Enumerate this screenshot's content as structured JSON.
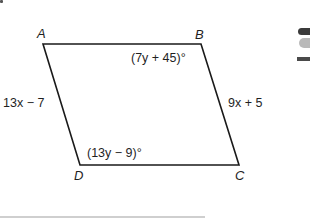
{
  "figure": {
    "type": "parallelogram",
    "vertices": [
      {
        "name": "A",
        "x": 43,
        "y": 44
      },
      {
        "name": "B",
        "x": 201,
        "y": 44
      },
      {
        "name": "C",
        "x": 239,
        "y": 165
      },
      {
        "name": "D",
        "x": 80,
        "y": 165
      }
    ],
    "stroke_color": "#1a1a1a",
    "side_labels": {
      "AD": "13x − 7",
      "BC": "9x + 5"
    },
    "angle_labels": {
      "B": "(7y + 45)°",
      "D": "(13y − 9)°"
    },
    "vertex_labels": {
      "A": "A",
      "B": "B",
      "C": "C",
      "D": "D"
    }
  }
}
